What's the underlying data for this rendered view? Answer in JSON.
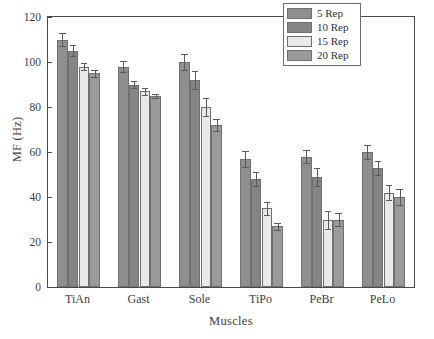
{
  "chart_data": {
    "type": "bar",
    "title": "",
    "xlabel": "Muscles",
    "ylabel": "MF (Hz)",
    "categories": [
      "TiAn",
      "Gast",
      "Sole",
      "TiPo",
      "PeBr",
      "PeLo"
    ],
    "ylim": [
      0,
      120
    ],
    "yticks": [
      0,
      20,
      40,
      60,
      80,
      100,
      120
    ],
    "ytick_labels": [
      "0",
      "20",
      "40",
      "60",
      "80",
      "100",
      "120"
    ],
    "grid": false,
    "legend_position": "top-right",
    "series": [
      {
        "name": "5 Rep",
        "color": "#8f8f8f",
        "values": [
          110,
          98,
          100,
          57,
          58,
          60
        ],
        "errors": [
          3,
          2.5,
          3.5,
          3.5,
          3,
          3
        ]
      },
      {
        "name": "10 Rep",
        "color": "#858585",
        "values": [
          105,
          90,
          92,
          48,
          49,
          53
        ],
        "errors": [
          2.5,
          1.5,
          4,
          3,
          4,
          3
        ]
      },
      {
        "name": "15 Rep",
        "color": "#e9e9e9",
        "values": [
          98,
          87,
          80,
          35,
          30,
          42
        ],
        "errors": [
          1.5,
          1.5,
          4,
          3,
          4,
          3.5
        ]
      },
      {
        "name": "20 Rep",
        "color": "#9a9a9a",
        "values": [
          95,
          85,
          72,
          27,
          30,
          40
        ],
        "errors": [
          1.5,
          1,
          2.5,
          1.5,
          3,
          3.5
        ]
      }
    ]
  },
  "legend": {
    "items": [
      {
        "label": "5 Rep"
      },
      {
        "label": "10 Rep"
      },
      {
        "label": "15 Rep"
      },
      {
        "label": "20 Rep"
      }
    ]
  },
  "axes": {
    "y_title": "MF (Hz)",
    "x_title": "Muscles"
  },
  "colors": {
    "frame": "#4a4a4a",
    "text": "#3d3d3d",
    "error_bar": "#5a5a5a"
  }
}
